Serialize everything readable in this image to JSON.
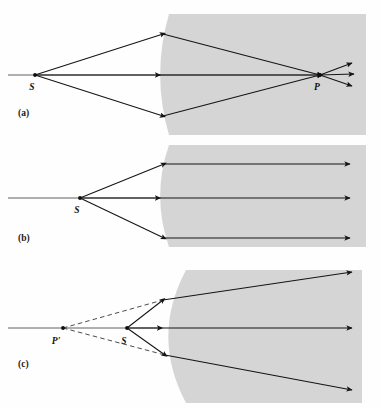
{
  "figure": {
    "background_color": "#fefefe",
    "medium_color": "#d5d5d5",
    "ray_color": "#141414",
    "axis_color": "#3a3a3a",
    "width": 380,
    "height": 409
  },
  "panels": [
    {
      "id": "a",
      "label": "(a)",
      "label_x": 18,
      "label_y": 116,
      "caption": "Converging rays from a real object S form a real image at P inside the denser medium",
      "points": [
        {
          "name": "S",
          "label": "S",
          "x": 35,
          "y": 75,
          "label_x": 32,
          "label_y": 90,
          "kind": "real-object"
        },
        {
          "name": "P",
          "label": "P",
          "x": 320,
          "y": 75,
          "label_x": 317,
          "label_y": 90,
          "kind": "real-image"
        }
      ],
      "medium_top": 14,
      "medium_bottom": 135,
      "medium_right": 366,
      "surface_vertex_x": 156,
      "surface_edge_x": 169,
      "rays": [
        {
          "name": "upper-ray",
          "from": [
            35,
            75
          ],
          "hit": [
            163,
            34
          ],
          "to": [
            320,
            75
          ]
        },
        {
          "name": "axial-ray",
          "from": [
            35,
            75
          ],
          "hit": [
            158,
            75
          ],
          "to": [
            320,
            75
          ]
        },
        {
          "name": "lower-ray",
          "from": [
            35,
            75
          ],
          "hit": [
            163,
            116
          ],
          "to": [
            320,
            75
          ]
        }
      ],
      "exit_rays": [
        {
          "name": "exit-ray-upper",
          "from": [
            320,
            75
          ],
          "to": [
            352,
            63
          ]
        },
        {
          "name": "exit-ray-middle",
          "from": [
            320,
            75
          ],
          "to": [
            354,
            74
          ]
        },
        {
          "name": "exit-ray-lower",
          "from": [
            320,
            75
          ],
          "to": [
            352,
            86
          ]
        }
      ]
    },
    {
      "id": "b",
      "label": "(b)",
      "label_x": 18,
      "label_y": 241,
      "caption": "Object S at the focal point: refracted rays emerge parallel to the axis",
      "points": [
        {
          "name": "S",
          "label": "S",
          "x": 80,
          "y": 198,
          "label_x": 77,
          "label_y": 213,
          "kind": "real-object"
        }
      ],
      "medium_top": 145,
      "medium_bottom": 247,
      "medium_right": 366,
      "surface_vertex_x": 156,
      "surface_edge_x": 169,
      "rays": [
        {
          "name": "upper-ray",
          "from": [
            80,
            198
          ],
          "hit": [
            164,
            164
          ],
          "to": [
            350,
            164
          ]
        },
        {
          "name": "axial-ray",
          "from": [
            80,
            198
          ],
          "hit": [
            158,
            198
          ],
          "to": [
            350,
            198
          ]
        },
        {
          "name": "lower-ray",
          "from": [
            80,
            198
          ],
          "hit": [
            164,
            238
          ],
          "to": [
            350,
            238
          ]
        }
      ],
      "exit_rays": []
    },
    {
      "id": "c",
      "label": "(c)",
      "label_x": 18,
      "label_y": 367,
      "caption": "Object S inside the focal point: refracted rays diverge and appear to come from virtual image P'",
      "points": [
        {
          "name": "P-prime",
          "label": "P'",
          "x": 63,
          "y": 328,
          "label_x": 56,
          "label_y": 344,
          "kind": "virtual-image"
        },
        {
          "name": "S",
          "label": "S",
          "x": 127,
          "y": 328,
          "label_x": 124,
          "label_y": 344,
          "kind": "real-object"
        }
      ],
      "medium_top": 270,
      "medium_bottom": 403,
      "medium_right": 362,
      "surface_vertex_x": 160,
      "surface_edge_x": 186,
      "rays": [
        {
          "name": "upper-ray",
          "from": [
            127,
            328
          ],
          "hit": [
            163,
            300
          ],
          "to": [
            352,
            272
          ]
        },
        {
          "name": "axial-ray",
          "from": [
            127,
            328
          ],
          "hit": [
            160,
            328
          ],
          "to": [
            352,
            328
          ]
        },
        {
          "name": "lower-ray",
          "from": [
            127,
            328
          ],
          "hit": [
            165,
            355
          ],
          "to": [
            352,
            390
          ]
        }
      ],
      "dashed_rays": [
        {
          "name": "virtual-ray-upper",
          "from": [
            63,
            328
          ],
          "to": [
            163,
            300
          ]
        },
        {
          "name": "virtual-ray-lower",
          "from": [
            63,
            328
          ],
          "to": [
            165,
            355
          ]
        }
      ],
      "exit_rays": []
    }
  ],
  "axes": [
    {
      "name": "optical-axis-a",
      "x1": 8,
      "y": 75,
      "x2": 320
    },
    {
      "name": "optical-axis-b",
      "x1": 8,
      "y": 198,
      "x2": 158
    },
    {
      "name": "optical-axis-c",
      "x1": 8,
      "y": 328,
      "x2": 160
    }
  ]
}
